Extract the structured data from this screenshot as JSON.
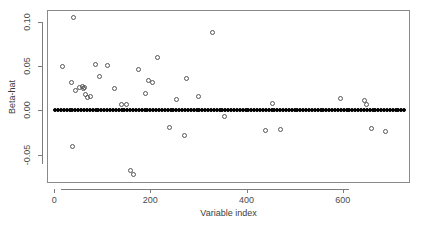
{
  "chart_data": {
    "type": "scatter",
    "title": "",
    "xlabel": "Variable index",
    "ylabel": "Beta-hat",
    "xlim": [
      -15,
      740
    ],
    "ylim": [
      -0.082,
      0.113
    ],
    "xticks": [
      0,
      200,
      400,
      600
    ],
    "xtick_labels": [
      "0",
      "200",
      "400",
      "600"
    ],
    "yticks": [
      -0.05,
      0.0,
      0.05,
      0.1
    ],
    "ytick_labels": [
      "-0.05",
      "0.00",
      "0.05",
      "0.10"
    ],
    "grid": false,
    "legend": null,
    "marker": "open-circle",
    "series": [
      {
        "name": "zero-coefficients",
        "description": "Dense band of near-zero beta-hat estimates spanning the full variable index range",
        "marker": "filled-dot",
        "x": [
          2,
          8,
          14,
          20,
          26,
          32,
          38,
          44,
          50,
          56,
          62,
          68,
          74,
          80,
          86,
          92,
          98,
          104,
          110,
          116,
          122,
          128,
          134,
          140,
          146,
          152,
          158,
          164,
          170,
          176,
          182,
          188,
          194,
          200,
          206,
          212,
          218,
          224,
          230,
          236,
          242,
          248,
          254,
          260,
          266,
          272,
          278,
          284,
          290,
          296,
          302,
          308,
          314,
          320,
          326,
          332,
          338,
          344,
          350,
          356,
          362,
          368,
          374,
          380,
          386,
          392,
          398,
          404,
          410,
          416,
          422,
          428,
          434,
          440,
          446,
          452,
          458,
          464,
          470,
          476,
          482,
          488,
          494,
          500,
          506,
          512,
          518,
          524,
          530,
          536,
          542,
          548,
          554,
          560,
          566,
          572,
          578,
          584,
          590,
          596,
          602,
          608,
          614,
          620,
          626,
          632,
          638,
          644,
          650,
          656,
          662,
          668,
          674,
          680,
          686,
          692,
          698,
          704,
          710,
          716,
          722,
          728
        ],
        "y": [
          0.0,
          0.0,
          0.0,
          0.0,
          0.0,
          0.0,
          0.0,
          0.0,
          0.0,
          0.0,
          0.0,
          0.0,
          0.0,
          0.0,
          0.0,
          0.0,
          0.0,
          0.0,
          0.0,
          0.0,
          0.0,
          0.0,
          0.0,
          0.0,
          0.0,
          0.0,
          0.0,
          0.0,
          0.0,
          0.0,
          0.0,
          0.0,
          0.0,
          0.0,
          0.0,
          0.0,
          0.0,
          0.0,
          0.0,
          0.0,
          0.0,
          0.0,
          0.0,
          0.0,
          0.0,
          0.0,
          0.0,
          0.0,
          0.0,
          0.0,
          0.0,
          0.0,
          0.0,
          0.0,
          0.0,
          0.0,
          0.0,
          0.0,
          0.0,
          0.0,
          0.0,
          0.0,
          0.0,
          0.0,
          0.0,
          0.0,
          0.0,
          0.0,
          0.0,
          0.0,
          0.0,
          0.0,
          0.0,
          0.0,
          0.0,
          0.0,
          0.0,
          0.0,
          0.0,
          0.0,
          0.0,
          0.0,
          0.0,
          0.0,
          0.0,
          0.0,
          0.0,
          0.0,
          0.0,
          0.0,
          0.0,
          0.0,
          0.0,
          0.0,
          0.0,
          0.0,
          0.0,
          0.0,
          0.0,
          0.0,
          0.0,
          0.0,
          0.0,
          0.0,
          0.0,
          0.0,
          0.0,
          0.0,
          0.0,
          0.0,
          0.0,
          0.0,
          0.0,
          0.0,
          0.0,
          0.0,
          0.0,
          0.0,
          0.0,
          0.0,
          0.0,
          0.0
        ]
      },
      {
        "name": "nonzero-coefficients",
        "description": "Selected variables with non-zero beta-hat estimates",
        "marker": "open-circle",
        "x": [
          40,
          18,
          36,
          45,
          52,
          58,
          60,
          64,
          66,
          70,
          76,
          38,
          86,
          95,
          110,
          125,
          140,
          150,
          158,
          165,
          175,
          190,
          196,
          205,
          215,
          240,
          255,
          270,
          275,
          300,
          330,
          355,
          440,
          455,
          470,
          596,
          645,
          650,
          660,
          690
        ],
        "y": [
          0.104,
          0.049,
          0.031,
          0.022,
          0.026,
          0.027,
          0.024,
          0.026,
          0.018,
          0.014,
          0.016,
          -0.041,
          0.052,
          0.038,
          0.051,
          0.024,
          0.006,
          0.007,
          -0.068,
          -0.072,
          0.046,
          0.019,
          0.033,
          0.031,
          0.059,
          -0.019,
          0.012,
          -0.029,
          0.036,
          0.015,
          0.088,
          -0.007,
          -0.023,
          0.008,
          -0.022,
          0.013,
          0.011,
          0.006,
          -0.021,
          -0.024
        ]
      }
    ]
  },
  "axes": {
    "x_title": "Variable index",
    "y_title": "Beta-hat",
    "x_ticks": [
      {
        "label": "0",
        "value": 0
      },
      {
        "label": "200",
        "value": 200
      },
      {
        "label": "400",
        "value": 400
      },
      {
        "label": "600",
        "value": 600
      }
    ],
    "y_ticks": [
      {
        "label": "0.10",
        "value": 0.1
      },
      {
        "label": "0.05",
        "value": 0.05
      },
      {
        "label": "0.00",
        "value": 0.0
      },
      {
        "label": "-0.05",
        "value": -0.05
      }
    ]
  },
  "colors": {
    "frame": "#8a8a8a",
    "axis": "#7d7d7d",
    "tick_text": "#4a4a4a",
    "title_text": "#3d3d3d",
    "point_open": "#555555",
    "point_dense": "#000000",
    "background": "#ffffff"
  }
}
